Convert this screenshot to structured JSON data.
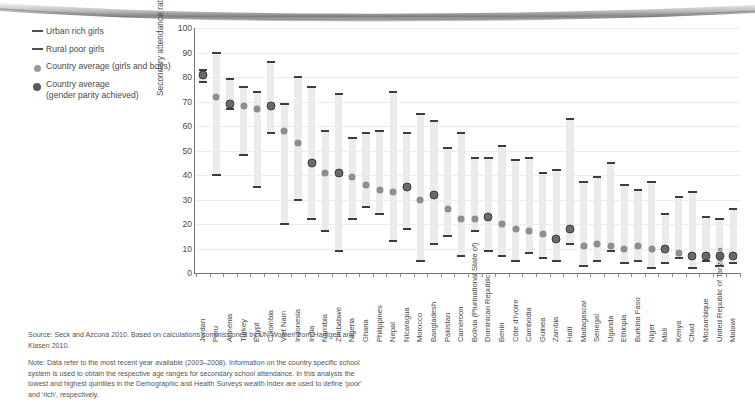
{
  "legend": {
    "items": [
      {
        "label": "Urban rich girls",
        "mark": "dash-icon"
      },
      {
        "label": "Rural poor girls",
        "mark": "dash-icon"
      },
      {
        "label": "Country average (girls and boys)",
        "mark": "light-dot-icon"
      },
      {
        "label": "Country average\n(gender parity achieved)",
        "mark": "dark-dot-icon"
      }
    ]
  },
  "notes": {
    "source": "Source: Seck and Azcona 2010. Based on calculations commissioned by UN Women from Harttgen and Klasen 2010.",
    "note": "Note: Data refer to the most recent year available (2003–2008). Information on the country specific school system is used to obtain the respective age ranges for secondary school attendance. In this analysis the lowest and highest quintiles in the Demographic and Health Surveys wealth Index are used to define 'poor' and 'rich', respectively."
  },
  "chart_data": {
    "type": "bar",
    "title": "",
    "xlabel": "",
    "ylabel": "Secondary attendance rates (%)",
    "ylim": [
      0,
      100
    ],
    "yticks": [
      0,
      10,
      20,
      30,
      40,
      50,
      60,
      70,
      80,
      90,
      100
    ],
    "grid": true,
    "legend_position": "top-left",
    "series": [
      {
        "name": "Urban rich girls",
        "role": "bar-top"
      },
      {
        "name": "Rural poor girls",
        "role": "bar-bottom"
      },
      {
        "name": "Country average (girls and boys)",
        "role": "marker-light"
      },
      {
        "name": "Country average (gender parity achieved)",
        "role": "marker-dark"
      }
    ],
    "categories": [
      "Jordan",
      "Peru",
      "Armenia",
      "Turkey",
      "Egypt",
      "Colombia",
      "Viet Nam",
      "Indonesia",
      "India",
      "Namibia",
      "Zimbabwe",
      "Nigeria",
      "Ghana",
      "Philippines",
      "Nepal",
      "Nicaragua",
      "Morocco",
      "Bangladesh",
      "Pakistan",
      "Cameroon",
      "Bolivia (Plurinational State of)",
      "Dominican Republic",
      "Benin",
      "Côte d'Ivoire",
      "Cambodia",
      "Guinea",
      "Zambia",
      "Haiti",
      "Madagascar",
      "Senegal",
      "Uganda",
      "Ethiopia",
      "Burkina Faso",
      "Niger",
      "Mali",
      "Kenya",
      "Chad",
      "Mozambique",
      "United Republic of Tanzania",
      "Malawi"
    ],
    "urban_rich_girls": [
      83,
      90,
      79,
      76,
      74,
      86,
      69,
      80,
      76,
      58,
      73,
      55,
      57,
      58,
      74,
      57,
      65,
      62,
      51,
      57,
      47,
      47,
      52,
      46,
      47,
      41,
      42,
      63,
      37,
      39,
      45,
      36,
      34,
      37,
      24,
      31,
      33,
      23,
      22,
      26
    ],
    "rural_poor_girls": [
      78,
      40,
      67,
      48,
      35,
      57,
      20,
      30,
      22,
      17,
      9,
      22,
      27,
      24,
      13,
      18,
      5,
      12,
      15,
      7,
      17,
      9,
      7,
      5,
      8,
      6,
      5,
      12,
      3,
      5,
      9,
      4,
      5,
      2,
      4,
      6,
      2,
      5,
      3,
      4
    ],
    "country_average_light": [
      null,
      72,
      null,
      68,
      67,
      null,
      58,
      53,
      null,
      41,
      null,
      39,
      36,
      34,
      33,
      null,
      30,
      null,
      26,
      22,
      22,
      null,
      20,
      18,
      17,
      16,
      null,
      null,
      11,
      12,
      11,
      10,
      11,
      10,
      null,
      8,
      null,
      null,
      null,
      null
    ],
    "country_average_dark": [
      81,
      null,
      69,
      null,
      null,
      68,
      null,
      null,
      45,
      null,
      41,
      null,
      null,
      null,
      null,
      35,
      null,
      32,
      null,
      null,
      null,
      23,
      null,
      null,
      null,
      null,
      14,
      18,
      null,
      null,
      null,
      null,
      null,
      null,
      10,
      null,
      7,
      7,
      7,
      7
    ]
  }
}
